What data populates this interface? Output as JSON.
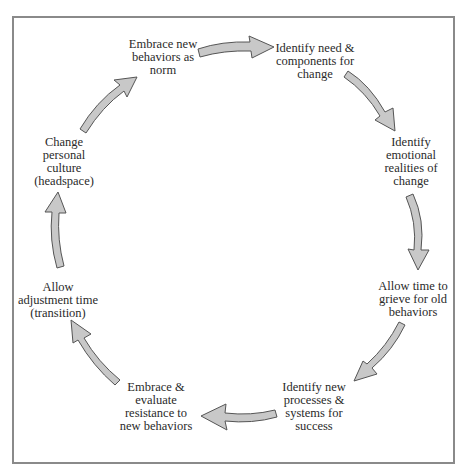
{
  "diagram": {
    "type": "cycle",
    "arrow_color": "#c8c8c8",
    "arrow_stroke": "#555555",
    "border_color": "#8a8a8a",
    "nodes": [
      {
        "id": "identify-need",
        "lines": [
          "Identify need &",
          "components for",
          "change"
        ]
      },
      {
        "id": "identify-emotional",
        "lines": [
          "Identify",
          "emotional",
          "realities of",
          "change"
        ]
      },
      {
        "id": "allow-grieve",
        "lines": [
          "Allow time to",
          "grieve for old",
          "behaviors"
        ]
      },
      {
        "id": "identify-processes",
        "lines": [
          "Identify new",
          "processes &",
          "systems for",
          "success"
        ]
      },
      {
        "id": "embrace-resistance",
        "lines": [
          "Embrace &",
          "evaluate",
          "resistance to",
          "new behaviors"
        ]
      },
      {
        "id": "allow-adjustment",
        "lines": [
          "Allow",
          "adjustment time",
          "(transition)"
        ]
      },
      {
        "id": "change-culture",
        "lines": [
          "Change",
          "personal",
          "culture",
          "(headspace)"
        ]
      },
      {
        "id": "embrace-norm",
        "lines": [
          "Embrace new",
          "behaviors as",
          "norm"
        ]
      }
    ],
    "edges": [
      {
        "from": "embrace-norm",
        "to": "identify-need"
      },
      {
        "from": "identify-need",
        "to": "identify-emotional"
      },
      {
        "from": "identify-emotional",
        "to": "allow-grieve"
      },
      {
        "from": "allow-grieve",
        "to": "identify-processes"
      },
      {
        "from": "identify-processes",
        "to": "embrace-resistance"
      },
      {
        "from": "embrace-resistance",
        "to": "allow-adjustment"
      },
      {
        "from": "allow-adjustment",
        "to": "change-culture"
      },
      {
        "from": "change-culture",
        "to": "embrace-norm"
      }
    ]
  }
}
